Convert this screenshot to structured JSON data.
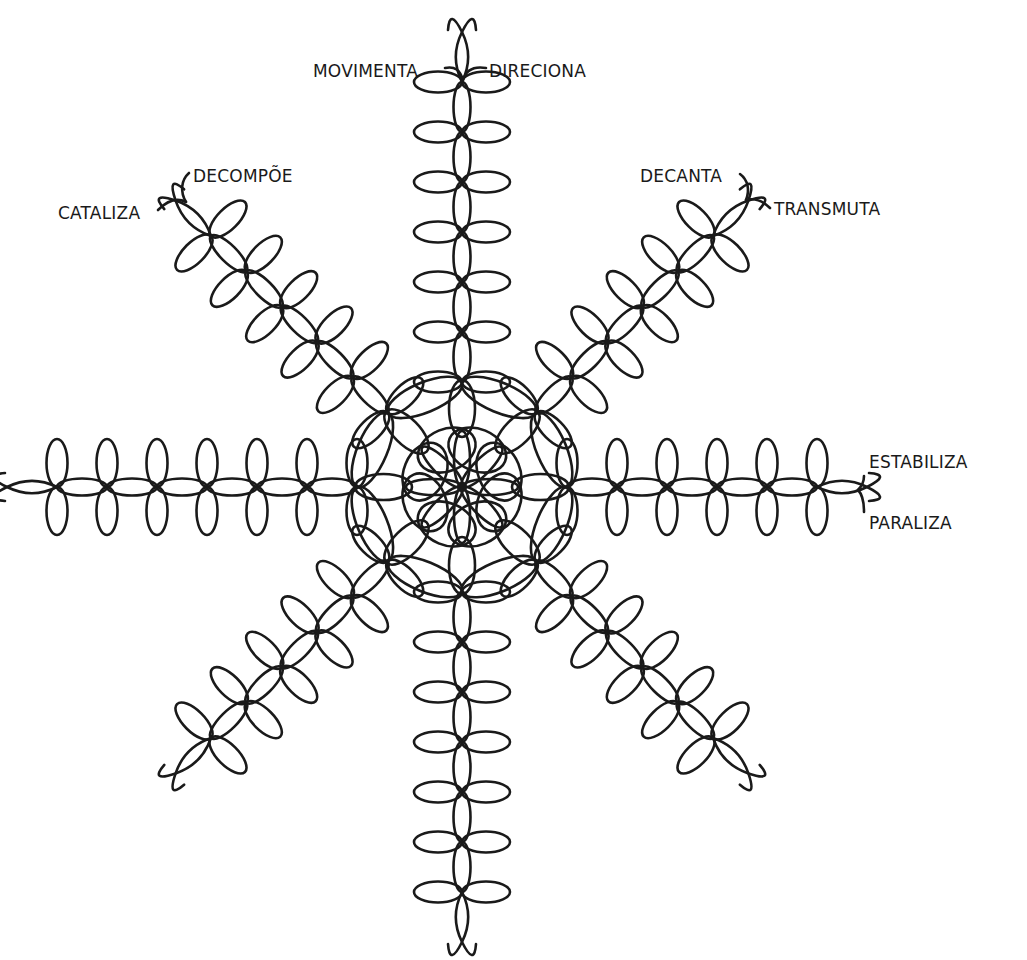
{
  "diagram": {
    "type": "radial-knot-mandala",
    "center": [
      462,
      487
    ],
    "stroke_color": "#1a1a1a",
    "background": "#ffffff",
    "hub": {
      "petals": 8,
      "petal_length": 56,
      "petal_width": 16,
      "loop_radius": 30,
      "loop_offset": 40
    },
    "ring": {
      "radius": 105,
      "nodes": 8
    },
    "arm": {
      "step": 50,
      "lens_width": 17,
      "cross_petal_length": 48,
      "cross_petal_width": 21
    },
    "arms": [
      {
        "id": "right",
        "angle": 0,
        "nodes": 6,
        "hook": true
      },
      {
        "id": "down-right",
        "angle": 45,
        "nodes": 6,
        "hook": true
      },
      {
        "id": "down",
        "angle": 90,
        "nodes": 7,
        "hook": true
      },
      {
        "id": "down-left",
        "angle": 135,
        "nodes": 6,
        "hook": true
      },
      {
        "id": "left",
        "angle": 180,
        "nodes": 7,
        "hook": true
      },
      {
        "id": "up-left",
        "angle": 225,
        "nodes": 6,
        "hook": true
      },
      {
        "id": "up",
        "angle": 270,
        "nodes": 7,
        "hook": true
      },
      {
        "id": "up-right",
        "angle": 315,
        "nodes": 6,
        "hook": true
      }
    ]
  },
  "labels": [
    {
      "id": "movimenta",
      "text": "MOVIMENTA",
      "x": 313,
      "y": 77,
      "anchor": "start"
    },
    {
      "id": "direciona",
      "text": "DIRECIONA",
      "x": 489,
      "y": 77,
      "anchor": "start"
    },
    {
      "id": "decompoe",
      "text": "DECOMPÕE",
      "x": 193,
      "y": 182,
      "anchor": "start"
    },
    {
      "id": "catalizia",
      "text": "CATALIZA",
      "x": 58,
      "y": 219,
      "anchor": "start"
    },
    {
      "id": "decanta",
      "text": "DECANTA",
      "x": 640,
      "y": 182,
      "anchor": "start"
    },
    {
      "id": "transmuta",
      "text": "TRANSMUTA",
      "x": 774,
      "y": 215,
      "anchor": "start"
    },
    {
      "id": "estabiliza",
      "text": "ESTABILIZA",
      "x": 869,
      "y": 468,
      "anchor": "start"
    },
    {
      "id": "paraliza",
      "text": "PARALIZA",
      "x": 869,
      "y": 529,
      "anchor": "start"
    }
  ],
  "label_connectors": [
    {
      "id": "movimenta-hook",
      "d": "M 445 68 C 455 66, 460 70, 463 80"
    },
    {
      "id": "direciona-hook",
      "d": "M 486 68 C 474 66, 466 70, 463 80"
    },
    {
      "id": "decompoe-hook",
      "d": "M 189 173 C 181 180, 180 192, 186 202"
    },
    {
      "id": "catalizia-hook",
      "d": "M 158 210 C 168 200, 178 198, 186 202"
    },
    {
      "id": "decanta-hook",
      "d": "M 740 174 C 748 180, 750 190, 746 200"
    },
    {
      "id": "transmuta-hook",
      "d": "M 770 208 C 762 200, 754 198, 746 200"
    },
    {
      "id": "estabiliza-hook",
      "d": "M 864 476 C 864 482, 862 486, 858 490"
    },
    {
      "id": "paraliza-hook",
      "d": "M 864 512 C 864 500, 862 494, 858 490"
    }
  ]
}
